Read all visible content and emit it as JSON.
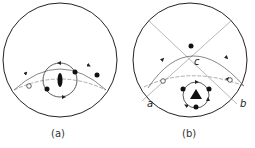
{
  "figures": [
    {
      "id": "a",
      "caption": "(a)",
      "primitive_circle": {
        "cx": 60,
        "cy": 60,
        "r": 57
      },
      "symmetry_element": "two-fold axis (lens symbol)",
      "points": {
        "filled": 4,
        "open": 1
      }
    },
    {
      "id": "b",
      "caption": "(b)",
      "primitive_circle": {
        "cx": 190,
        "cy": 60,
        "r": 57
      },
      "symmetry_element": "three-fold axis (triangle symbol)",
      "labels": [
        "a",
        "b",
        "c"
      ],
      "points": {
        "filled": 4,
        "open": 3
      }
    }
  ],
  "colors": {
    "line": "#222222",
    "thin_line": "#888888",
    "background": "#ffffff"
  }
}
